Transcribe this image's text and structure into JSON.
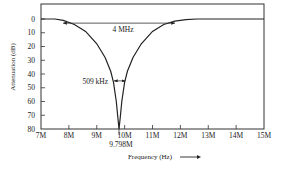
{
  "chart_data": {
    "type": "line",
    "title": "",
    "xlabel": "Frequency (Hz)",
    "ylabel": "Attenuation (dB)",
    "xlim": [
      7,
      15
    ],
    "ylim": [
      80,
      0
    ],
    "y_inverted": true,
    "grid": false,
    "x_ticks": [
      "7M",
      "8M",
      "9M",
      "10M",
      "11M",
      "12M",
      "13M",
      "14M",
      "15M"
    ],
    "y_ticks": [
      "0",
      "10",
      "20",
      "30",
      "40",
      "50",
      "60",
      "70",
      "80"
    ],
    "series": [
      {
        "name": "Notch filter response",
        "x_mhz": [
          7.0,
          7.5,
          7.8,
          8.2,
          8.6,
          9.0,
          9.3,
          9.5,
          9.6,
          9.7,
          9.76,
          9.798,
          9.84,
          9.9,
          10.0,
          10.1,
          10.3,
          10.6,
          11.0,
          11.4,
          11.8,
          12.2,
          12.6,
          13.0,
          14.0,
          15.0
        ],
        "attenuation_db": [
          0,
          0,
          1,
          4,
          9,
          18,
          28,
          38,
          46,
          60,
          72,
          80,
          72,
          60,
          46,
          38,
          28,
          18,
          9,
          4,
          1.5,
          0.5,
          0,
          0,
          0,
          0
        ]
      }
    ],
    "annotations": [
      {
        "text": "4 MHz",
        "type": "double-arrow",
        "from_mhz": 7.8,
        "to_mhz": 11.8,
        "at_db": 3
      },
      {
        "text": "509 kHz",
        "type": "double-arrow",
        "from_mhz": 9.55,
        "to_mhz": 10.06,
        "at_db": 45
      },
      {
        "text": "9.798M",
        "type": "tick-label",
        "at_mhz": 9.798
      }
    ],
    "notch_center": "9.798M",
    "bandwidth_3db": "4 MHz",
    "bandwidth_deep": "509 kHz"
  },
  "labels": {
    "ylabel": "Attenuation (dB)",
    "xlabel": "Frequency (Hz)",
    "x_arrow": "——▶",
    "ann_4mhz": "4 MHz",
    "ann_509khz": "509 kHz",
    "ann_center": "9.798M"
  }
}
